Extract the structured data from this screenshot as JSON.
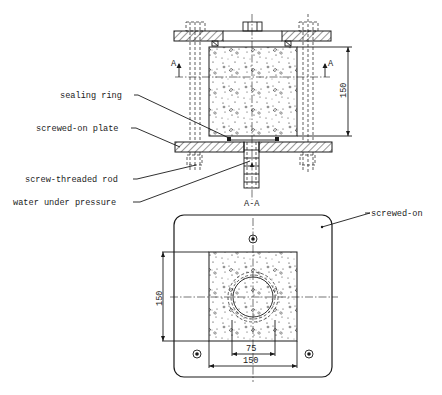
{
  "figure": {
    "type": "technical-drawing",
    "labels": {
      "sealing_ring": "sealing ring",
      "screwed_on_plate": "screwed-on plate",
      "screw_threaded_rod": "screw-threaded rod",
      "water_under_pressure": "water under pressure",
      "screwed_on": "screwed-on"
    },
    "section": {
      "marker_left": "A",
      "marker_right": "A",
      "title": "A-A"
    },
    "dimensions": {
      "elevation_height": "150",
      "plan_height": "150",
      "plan_width": "150",
      "plan_inner_width": "75"
    },
    "colors": {
      "ink": "#1a1a1a",
      "paper": "#ffffff"
    }
  }
}
